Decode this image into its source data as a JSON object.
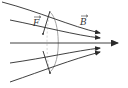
{
  "diagram": {
    "labels": {
      "field": "B",
      "force": "F"
    },
    "colors": {
      "line": "#2a2a2a",
      "loop": "#9a9a9a",
      "background": "#ffffff"
    },
    "field_lines": [
      {
        "name": "top",
        "d": "M 2 2 C 40 12, 70 26, 100 33"
      },
      {
        "name": "upper",
        "d": "M 10 20 C 45 27, 75 35, 100 38"
      },
      {
        "name": "center",
        "d": "M 10 43 L 118 43"
      },
      {
        "name": "lower",
        "d": "M 10 63 C 45 58, 75 51, 100 48"
      },
      {
        "name": "bottom",
        "d": "M 10 82 C 45 70, 70 60, 100 52"
      }
    ]
  }
}
